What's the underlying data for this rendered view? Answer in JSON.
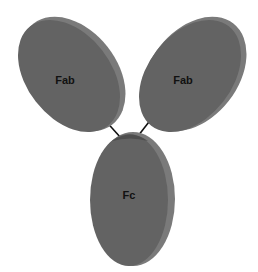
{
  "diagram": {
    "colors": {
      "domain_fill": "#636363",
      "domain_edge": "#7a7a7a",
      "domain_shadow": "#4a4a4a",
      "linker": "#111111",
      "background": "#ffffff"
    },
    "domains": [
      {
        "id": "fab-left",
        "label": "Fab"
      },
      {
        "id": "fab-right",
        "label": "Fab"
      },
      {
        "id": "fc",
        "label": "Fc"
      }
    ],
    "linkers": [
      {
        "from": "fab-left",
        "to": "fc"
      },
      {
        "from": "fab-right",
        "to": "fc"
      }
    ]
  }
}
